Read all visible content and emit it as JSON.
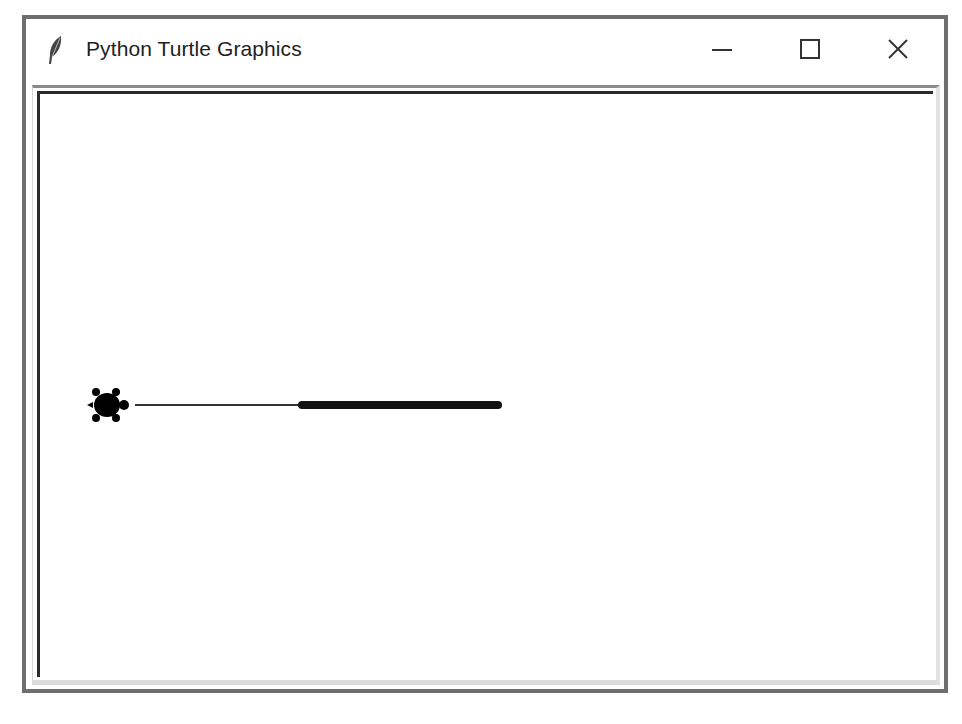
{
  "window": {
    "title": "Python Turtle Graphics",
    "app_icon": "feather-icon",
    "controls": {
      "minimize": "minimize-icon",
      "maximize": "maximize-icon",
      "close": "close-icon"
    }
  },
  "canvas": {
    "background": "#ffffff",
    "turtle": {
      "shape": "turtle",
      "color": "#000000",
      "x": 67,
      "y": 311,
      "heading": "east"
    },
    "segments": [
      {
        "x1": 95,
        "y1": 311,
        "x2": 262,
        "y2": 311,
        "width": 2,
        "color": "#333333"
      },
      {
        "x1": 262,
        "y1": 311,
        "x2": 458,
        "y2": 311,
        "width": 8,
        "color": "#111111"
      }
    ]
  }
}
